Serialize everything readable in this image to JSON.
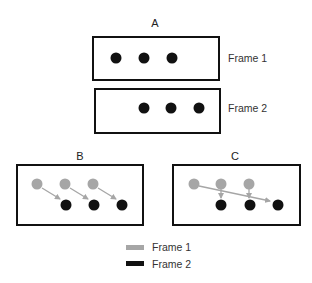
{
  "colors": {
    "frame1": "#a6a6a6",
    "frame2": "#111111",
    "arrow": "#a6a6a6",
    "border": "#111111"
  },
  "panelA": {
    "label": "A",
    "frame1_label": "Frame 1",
    "frame2_label": "Frame 2",
    "frame1_dot_count": 3,
    "frame2_dot_count": 3,
    "shift": "right by one dot spacing"
  },
  "panelB": {
    "label": "B",
    "correspondence": "each dot moves one step diagonally to the nearest frame-2 dot",
    "matches": [
      [
        0,
        0
      ],
      [
        1,
        1
      ],
      [
        2,
        2
      ]
    ]
  },
  "panelC": {
    "label": "C",
    "correspondence": "first dot jumps to last position; others move straight down",
    "matches": [
      [
        0,
        2
      ],
      [
        1,
        0
      ],
      [
        2,
        1
      ]
    ]
  },
  "legend": {
    "items": [
      {
        "label": "Frame 1",
        "color": "#a6a6a6"
      },
      {
        "label": "Frame 2",
        "color": "#111111"
      }
    ]
  }
}
